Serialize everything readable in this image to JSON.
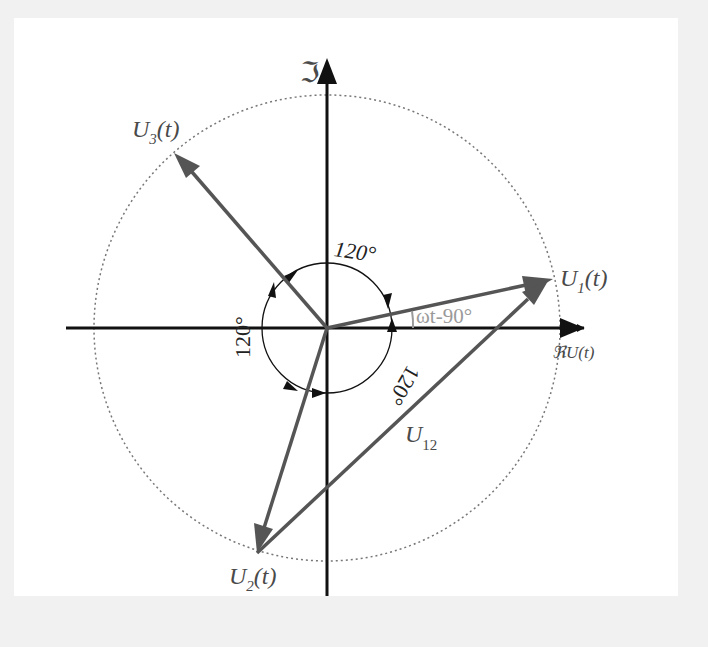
{
  "diagram": {
    "title": "",
    "axes": {
      "imag_label": "ℑ",
      "real_label": "ℜU(t)"
    },
    "phasors": [
      {
        "name": "U1",
        "label_main": "U",
        "label_sub": "1",
        "label_tail": "(t)",
        "color": "#555555"
      },
      {
        "name": "U2",
        "label_main": "U",
        "label_sub": "2",
        "label_tail": "(t)",
        "color": "#555555"
      },
      {
        "name": "U3",
        "label_main": "U",
        "label_sub": "3",
        "label_tail": "(t)",
        "color": "#555555"
      }
    ],
    "line_voltage": {
      "label_main": "U",
      "label_sub": "12",
      "color": "#555555"
    },
    "angles": {
      "top": "120°",
      "left": "120°",
      "bottom_right": "120°",
      "phase": "ωt-90°"
    },
    "colors": {
      "axis": "#111111",
      "phasor": "#555555",
      "circle": "#777777",
      "phase_label": "#9a9a9a",
      "background": "#ffffff"
    }
  }
}
